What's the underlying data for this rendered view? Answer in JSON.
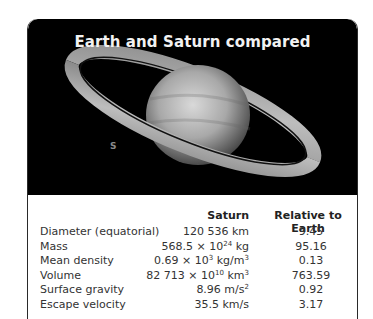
{
  "title": "Earth and Saturn compared",
  "image": {
    "subject": "Saturn with rings (photograph)",
    "moon_label": "S"
  },
  "table": {
    "headers": {
      "property": "",
      "saturn": "Saturn",
      "relative": "Relative to Earth"
    },
    "rows": [
      {
        "label": "Diameter (equatorial)",
        "saturn_base": "120 536 km",
        "saturn_exp": "",
        "saturn_unit": "",
        "relative": "9.45"
      },
      {
        "label": "Mass",
        "saturn_base": "568.5 × 10",
        "saturn_exp": "24",
        "saturn_unit": " kg",
        "relative": "95.16"
      },
      {
        "label": "Mean density",
        "saturn_base": "0.69 × 10",
        "saturn_exp": "3",
        "saturn_unit": " kg/m",
        "saturn_unit_exp": "3",
        "relative": "0.13"
      },
      {
        "label": "Volume",
        "saturn_base": "82 713 × 10",
        "saturn_exp": "10",
        "saturn_unit": " km",
        "saturn_unit_exp": "3",
        "relative": "763.59"
      },
      {
        "label": "Surface gravity",
        "saturn_base": "8.96 m/s",
        "saturn_exp": "2",
        "saturn_unit": "",
        "relative": "0.92"
      },
      {
        "label": "Escape velocity",
        "saturn_base": "35.5 km/s",
        "saturn_exp": "",
        "saturn_unit": "",
        "relative": "3.17"
      }
    ]
  }
}
